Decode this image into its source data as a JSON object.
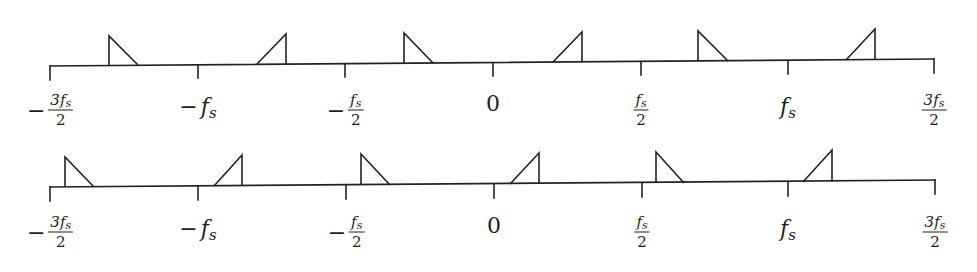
{
  "diagram": {
    "line_color": "#222222",
    "axes": [
      {
        "id": "top",
        "x_start": 50,
        "y_start": 66,
        "x_end": 934,
        "y_end": 59,
        "ticks": [
          {
            "x": 50,
            "y0": 66,
            "y1": 80
          },
          {
            "x": 198,
            "y0": 65,
            "y1": 78
          },
          {
            "x": 345,
            "y0": 64,
            "y1": 77
          },
          {
            "x": 493,
            "y0": 63,
            "y1": 76
          },
          {
            "x": 641,
            "y0": 62,
            "y1": 75
          },
          {
            "x": 788,
            "y0": 61,
            "y1": 74
          },
          {
            "x": 934,
            "y0": 59,
            "y1": 73
          }
        ],
        "triangles": [
          {
            "type": "down",
            "vx": 109,
            "top": 36,
            "base": 65,
            "sx": 138
          },
          {
            "type": "up",
            "vx": 286,
            "top": 34,
            "base": 64,
            "sx": 257
          },
          {
            "type": "down",
            "vx": 404,
            "top": 33,
            "base": 63,
            "sx": 433
          },
          {
            "type": "up",
            "vx": 582,
            "top": 32,
            "base": 62,
            "sx": 553
          },
          {
            "type": "down",
            "vx": 698,
            "top": 31,
            "base": 61,
            "sx": 728
          },
          {
            "type": "up",
            "vx": 875,
            "top": 29,
            "base": 60,
            "sx": 846
          }
        ],
        "labels": [
          {
            "x": 50,
            "y": 110,
            "neg": "−",
            "kind": "frac",
            "num_coef": "3",
            "num_var": "f",
            "num_sub": "s",
            "den": "2"
          },
          {
            "x": 198,
            "y": 106,
            "neg": "−",
            "kind": "simple",
            "var": "f",
            "sub": "s"
          },
          {
            "x": 345,
            "y": 110,
            "neg": "−",
            "kind": "frac",
            "num_coef": "",
            "num_var": "f",
            "num_sub": "s",
            "den": "2"
          },
          {
            "x": 493,
            "y": 103,
            "neg": "",
            "kind": "zero",
            "text": "0"
          },
          {
            "x": 641,
            "y": 110,
            "neg": "",
            "kind": "frac",
            "num_coef": "",
            "num_var": "f",
            "num_sub": "s",
            "den": "2"
          },
          {
            "x": 788,
            "y": 106,
            "neg": "",
            "kind": "simple",
            "var": "f",
            "sub": "s"
          },
          {
            "x": 934,
            "y": 110,
            "neg": "",
            "kind": "frac",
            "num_coef": "3",
            "num_var": "f",
            "num_sub": "s",
            "den": "2"
          }
        ]
      },
      {
        "id": "bottom",
        "x_start": 50,
        "y_start": 187,
        "x_end": 935,
        "y_end": 180,
        "ticks": [
          {
            "x": 50,
            "y0": 187,
            "y1": 201
          },
          {
            "x": 198,
            "y0": 186,
            "y1": 200
          },
          {
            "x": 346,
            "y0": 185,
            "y1": 199
          },
          {
            "x": 494,
            "y0": 184,
            "y1": 198
          },
          {
            "x": 642,
            "y0": 183,
            "y1": 197
          },
          {
            "x": 788,
            "y0": 182,
            "y1": 196
          },
          {
            "x": 935,
            "y0": 180,
            "y1": 194
          }
        ],
        "triangles": [
          {
            "type": "down",
            "vx": 65,
            "top": 157,
            "base": 187,
            "sx": 94
          },
          {
            "type": "up",
            "vx": 242,
            "top": 155,
            "base": 186,
            "sx": 214
          },
          {
            "type": "down",
            "vx": 361,
            "top": 154,
            "base": 185,
            "sx": 390
          },
          {
            "type": "up",
            "vx": 539,
            "top": 153,
            "base": 184,
            "sx": 510
          },
          {
            "type": "down",
            "vx": 656,
            "top": 152,
            "base": 183,
            "sx": 684
          },
          {
            "type": "up",
            "vx": 832,
            "top": 150,
            "base": 182,
            "sx": 803
          }
        ],
        "labels": [
          {
            "x": 50,
            "y": 232,
            "neg": "−",
            "kind": "frac",
            "num_coef": "3",
            "num_var": "f",
            "num_sub": "s",
            "den": "2"
          },
          {
            "x": 198,
            "y": 228,
            "neg": "−",
            "kind": "simple",
            "var": "f",
            "sub": "s"
          },
          {
            "x": 346,
            "y": 232,
            "neg": "−",
            "kind": "frac",
            "num_coef": "",
            "num_var": "f",
            "num_sub": "s",
            "den": "2"
          },
          {
            "x": 494,
            "y": 225,
            "neg": "",
            "kind": "zero",
            "text": "0"
          },
          {
            "x": 642,
            "y": 232,
            "neg": "",
            "kind": "frac",
            "num_coef": "",
            "num_var": "f",
            "num_sub": "s",
            "den": "2"
          },
          {
            "x": 788,
            "y": 228,
            "neg": "",
            "kind": "simple",
            "var": "f",
            "sub": "s"
          },
          {
            "x": 935,
            "y": 232,
            "neg": "",
            "kind": "frac",
            "num_coef": "3",
            "num_var": "f",
            "num_sub": "s",
            "den": "2"
          }
        ]
      }
    ]
  }
}
